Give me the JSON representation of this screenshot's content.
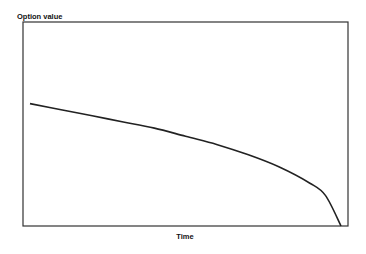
{
  "chart_data": {
    "type": "line",
    "title": "",
    "xlabel": "Time",
    "ylabel": "Option value",
    "grid": false,
    "legend": null,
    "x": [
      0,
      0.1,
      0.2,
      0.3,
      0.4,
      0.5,
      0.6,
      0.7,
      0.8,
      0.9,
      0.95,
      1.0
    ],
    "series": [
      {
        "name": "Option value",
        "values": [
          0.6,
          0.57,
          0.54,
          0.51,
          0.48,
          0.44,
          0.4,
          0.35,
          0.29,
          0.21,
          0.15,
          0.0
        ]
      }
    ],
    "xlim": [
      0,
      1
    ],
    "ylim": [
      0,
      1
    ],
    "ticks": "none"
  },
  "labels": {
    "y_axis": "Option value",
    "x_axis": "Time"
  }
}
